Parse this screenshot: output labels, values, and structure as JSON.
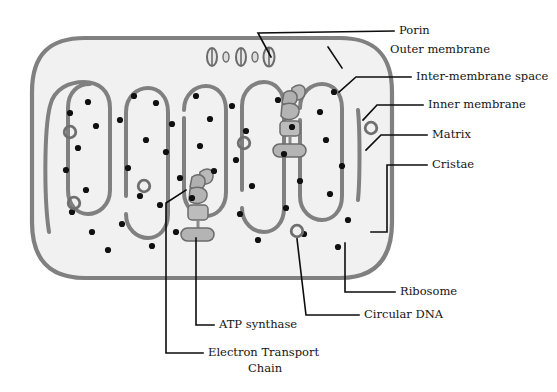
{
  "figure": {
    "background_color": "#ffffff"
  },
  "colors": {
    "outer_membrane": "#808080",
    "inner_membrane": "#808080",
    "cytosol_fill": "#f1f1f1",
    "matrix_fill": "#f4f4f4",
    "ribosome": "#101010",
    "circular_dna_stroke": "#6f6f6f",
    "protein_complex_fill": "#b4b4b4",
    "protein_complex_stroke": "#6b6b6b",
    "porin_fill": "#e8e8e8",
    "porin_stroke": "#6b6b6b",
    "leader_line": "#0d0d0d",
    "label_text": "#141414"
  },
  "labels": [
    {
      "id": "porin",
      "text": "Porin",
      "x": 399,
      "y": 31,
      "anchor": "start",
      "multiline": false
    },
    {
      "id": "outer-membrane",
      "text": "Outer membrane",
      "x": 390,
      "y": 50,
      "anchor": "start",
      "multiline": false
    },
    {
      "id": "inter-membrane",
      "text": "Inter-membrane space",
      "x": 416,
      "y": 77,
      "anchor": "start",
      "multiline": false
    },
    {
      "id": "inner-membrane",
      "text": "Inner membrane",
      "x": 428,
      "y": 105,
      "anchor": "start",
      "multiline": false
    },
    {
      "id": "matrix",
      "text": "Matrix",
      "x": 432,
      "y": 135,
      "anchor": "start",
      "multiline": false
    },
    {
      "id": "cristae",
      "text": "Cristae",
      "x": 432,
      "y": 165,
      "anchor": "start",
      "multiline": false
    },
    {
      "id": "ribosome",
      "text": "Ribosome",
      "x": 400,
      "y": 292,
      "anchor": "start",
      "multiline": false
    },
    {
      "id": "circular-dna",
      "text": "Circular DNA",
      "x": 364,
      "y": 315,
      "anchor": "start",
      "multiline": false
    },
    {
      "id": "atp-synthase",
      "text": "ATP synthase",
      "x": 219,
      "y": 325,
      "anchor": "start",
      "multiline": false
    }
  ],
  "label_multiline": {
    "electron_transport_chain": {
      "id": "electron-transport-chain",
      "line1": "Electron Transport",
      "line2": "Chain",
      "x": 208,
      "y1": 353,
      "y2": 369,
      "anchor": "start"
    }
  },
  "structures": {
    "outer_membrane": {
      "name": "outer-membrane-boundary",
      "shape": "rounded-oval-capsule",
      "stroke_width": 4.2
    },
    "inner_membrane": {
      "name": "inner-membrane-cristae",
      "description": "continuous serpentine fold forming finger-like cristae",
      "stroke_width": 4.0,
      "cristae_count": 11
    },
    "porins": {
      "name": "porin-channels",
      "count": 3,
      "positions_x": [
        216,
        243,
        271
      ],
      "position_y": 57
    },
    "ribosomes": {
      "name": "ribosome-particles",
      "count": 46,
      "radius": 3.1
    },
    "circular_dna": {
      "name": "circular-dna-rings",
      "count": 6,
      "outer_radius": 7.2,
      "inner_radius": 4.4
    },
    "etc_complexes": {
      "name": "electron-transport-chain-complexes",
      "count": 2,
      "description": "chains of membrane protein complexes terminating in an ATP synthase"
    }
  },
  "geometry": {
    "ribosome_points": [
      [
        70,
        113
      ],
      [
        88,
        102
      ],
      [
        96,
        126
      ],
      [
        78,
        148
      ],
      [
        66,
        170
      ],
      [
        86,
        190
      ],
      [
        72,
        212
      ],
      [
        92,
        232
      ],
      [
        108,
        250
      ],
      [
        120,
        120
      ],
      [
        134,
        96
      ],
      [
        146,
        140
      ],
      [
        128,
        168
      ],
      [
        140,
        196
      ],
      [
        122,
        224
      ],
      [
        152,
        246
      ],
      [
        156,
        103
      ],
      [
        172,
        124
      ],
      [
        166,
        152
      ],
      [
        180,
        178
      ],
      [
        160,
        205
      ],
      [
        176,
        232
      ],
      [
        196,
        96
      ],
      [
        210,
        119
      ],
      [
        200,
        146
      ],
      [
        214,
        171
      ],
      [
        192,
        198
      ],
      [
        232,
        106
      ],
      [
        246,
        131
      ],
      [
        236,
        160
      ],
      [
        252,
        186
      ],
      [
        240,
        214
      ],
      [
        258,
        240
      ],
      [
        278,
        100
      ],
      [
        292,
        127
      ],
      [
        284,
        154
      ],
      [
        300,
        181
      ],
      [
        286,
        208
      ],
      [
        304,
        234
      ],
      [
        320,
        112
      ],
      [
        334,
        92
      ],
      [
        326,
        140
      ],
      [
        342,
        166
      ],
      [
        330,
        194
      ],
      [
        348,
        220
      ],
      [
        338,
        247
      ]
    ],
    "dna_ring_points": [
      [
        70,
        132
      ],
      [
        74,
        203
      ],
      [
        144,
        186
      ],
      [
        244,
        143
      ],
      [
        297,
        231
      ],
      [
        371,
        128
      ]
    ],
    "etc_clusters": [
      {
        "x": 196,
        "y": 172,
        "label": "lower-left-etc"
      },
      {
        "x": 288,
        "y": 88,
        "label": "upper-right-etc"
      }
    ]
  },
  "leaders": [
    {
      "id": "porin-leader",
      "points": "271,57 258,33 394,31"
    },
    {
      "id": "outer-membrane-leader",
      "points": "328,47 342,68"
    },
    {
      "id": "inter-membrane-leader",
      "points": "411,77 356,77 339,92"
    },
    {
      "id": "inner-membrane-leader",
      "points": "423,105 377,105 363,120"
    },
    {
      "id": "matrix-leader",
      "points": "427,135 381,135 366,150"
    },
    {
      "id": "cristae-leader",
      "points": "427,165 387,165 387,232 371,232"
    },
    {
      "id": "ribosome-leader",
      "points": "395,292 345,292 345,243"
    },
    {
      "id": "circular-dna-leader",
      "points": "359,315 306,315 297,239"
    },
    {
      "id": "atp-synthase-leader",
      "points": "214,325 196,325 196,238"
    },
    {
      "id": "etc-leader",
      "points": "203,353 166,353 166,203 186,190"
    }
  ]
}
